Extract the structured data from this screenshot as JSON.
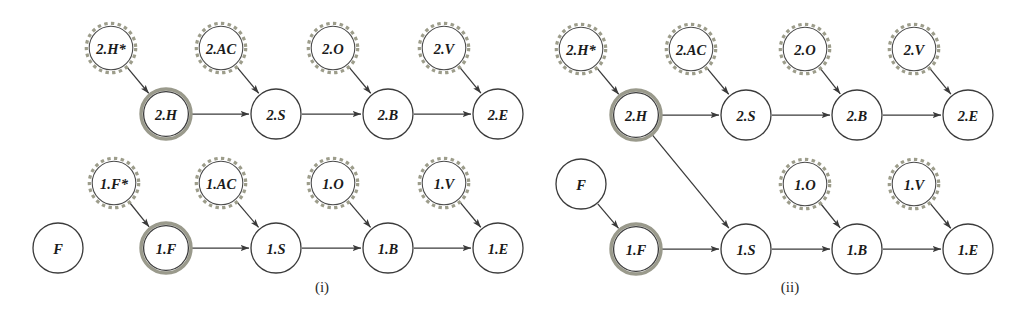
{
  "figure": {
    "background_color": "#ffffff",
    "node_radius": 25,
    "dashed_node_radius": 23,
    "colors": {
      "stroke_dark": "#3b3b3b",
      "stroke_highlight": "#9a9a8c",
      "stroke_dashed": "#9d9d8b",
      "label_text": "#1b1b1b",
      "caption_text": "#2a2a2a",
      "edge": "#3a3a3a"
    },
    "panels": [
      {
        "id": "panel-i",
        "caption": "(i)",
        "caption_x": 322,
        "caption_y": 287,
        "nodes": [
          {
            "id": "i-2H-star",
            "label": "2.H*",
            "x": 111,
            "y": 48,
            "style": "dashed"
          },
          {
            "id": "i-2AC",
            "label": "2.AC",
            "x": 221,
            "y": 48,
            "style": "dashed"
          },
          {
            "id": "i-2O",
            "label": "2.O",
            "x": 333,
            "y": 48,
            "style": "dashed"
          },
          {
            "id": "i-2V",
            "label": "2.V",
            "x": 444,
            "y": 48,
            "style": "dashed"
          },
          {
            "id": "i-2H",
            "label": "2.H",
            "x": 166,
            "y": 114,
            "style": "double"
          },
          {
            "id": "i-2S",
            "label": "2.S",
            "x": 276,
            "y": 114,
            "style": "plain"
          },
          {
            "id": "i-2B",
            "label": "2.B",
            "x": 388,
            "y": 114,
            "style": "plain"
          },
          {
            "id": "i-2E",
            "label": "2.E",
            "x": 498,
            "y": 114,
            "style": "plain"
          },
          {
            "id": "i-1F-star",
            "label": "1.F*",
            "x": 114,
            "y": 183,
            "style": "dashed"
          },
          {
            "id": "i-1AC",
            "label": "1.AC",
            "x": 221,
            "y": 183,
            "style": "dashed"
          },
          {
            "id": "i-1O",
            "label": "1.O",
            "x": 333,
            "y": 183,
            "style": "dashed"
          },
          {
            "id": "i-1V",
            "label": "1.V",
            "x": 444,
            "y": 183,
            "style": "dashed"
          },
          {
            "id": "i-F",
            "label": "F",
            "x": 58,
            "y": 248,
            "style": "plain"
          },
          {
            "id": "i-1F",
            "label": "1.F",
            "x": 166,
            "y": 248,
            "style": "double"
          },
          {
            "id": "i-1S",
            "label": "1.S",
            "x": 276,
            "y": 248,
            "style": "plain"
          },
          {
            "id": "i-1B",
            "label": "1.B",
            "x": 388,
            "y": 248,
            "style": "plain"
          },
          {
            "id": "i-1E",
            "label": "1.E",
            "x": 498,
            "y": 248,
            "style": "plain"
          }
        ],
        "edges": [
          {
            "from": "i-2H-star",
            "to": "i-2H"
          },
          {
            "from": "i-2AC",
            "to": "i-2S"
          },
          {
            "from": "i-2O",
            "to": "i-2B"
          },
          {
            "from": "i-2V",
            "to": "i-2E"
          },
          {
            "from": "i-2H",
            "to": "i-2S"
          },
          {
            "from": "i-2S",
            "to": "i-2B"
          },
          {
            "from": "i-2B",
            "to": "i-2E"
          },
          {
            "from": "i-1F-star",
            "to": "i-1F"
          },
          {
            "from": "i-1AC",
            "to": "i-1S"
          },
          {
            "from": "i-1O",
            "to": "i-1B"
          },
          {
            "from": "i-1V",
            "to": "i-1E"
          },
          {
            "from": "i-1F",
            "to": "i-1S"
          },
          {
            "from": "i-1S",
            "to": "i-1B"
          },
          {
            "from": "i-1B",
            "to": "i-1E"
          }
        ]
      },
      {
        "id": "panel-ii",
        "caption": "(ii)",
        "caption_x": 790,
        "caption_y": 287,
        "nodes": [
          {
            "id": "ii-2H-star",
            "label": "2.H*",
            "x": 581,
            "y": 49,
            "style": "dashed"
          },
          {
            "id": "ii-2AC",
            "label": "2.AC",
            "x": 691,
            "y": 49,
            "style": "dashed"
          },
          {
            "id": "ii-2O",
            "label": "2.O",
            "x": 805,
            "y": 49,
            "style": "dashed"
          },
          {
            "id": "ii-2V",
            "label": "2.V",
            "x": 914,
            "y": 49,
            "style": "dashed"
          },
          {
            "id": "ii-2H",
            "label": "2.H",
            "x": 636,
            "y": 115,
            "style": "double"
          },
          {
            "id": "ii-2S",
            "label": "2.S",
            "x": 746,
            "y": 115,
            "style": "plain"
          },
          {
            "id": "ii-2B",
            "label": "2.B",
            "x": 857,
            "y": 115,
            "style": "plain"
          },
          {
            "id": "ii-2E",
            "label": "2.E",
            "x": 968,
            "y": 115,
            "style": "plain"
          },
          {
            "id": "ii-F",
            "label": "F",
            "x": 581,
            "y": 184,
            "style": "plain"
          },
          {
            "id": "ii-1O",
            "label": "1.O",
            "x": 805,
            "y": 184,
            "style": "dashed"
          },
          {
            "id": "ii-1V",
            "label": "1.V",
            "x": 914,
            "y": 184,
            "style": "dashed"
          },
          {
            "id": "ii-1F",
            "label": "1.F",
            "x": 636,
            "y": 249,
            "style": "double"
          },
          {
            "id": "ii-1S",
            "label": "1.S",
            "x": 746,
            "y": 249,
            "style": "plain"
          },
          {
            "id": "ii-1B",
            "label": "1.B",
            "x": 857,
            "y": 249,
            "style": "plain"
          },
          {
            "id": "ii-1E",
            "label": "1.E",
            "x": 968,
            "y": 249,
            "style": "plain"
          }
        ],
        "edges": [
          {
            "from": "ii-2H-star",
            "to": "ii-2H"
          },
          {
            "from": "ii-2AC",
            "to": "ii-2S"
          },
          {
            "from": "ii-2O",
            "to": "ii-2B"
          },
          {
            "from": "ii-2V",
            "to": "ii-2E"
          },
          {
            "from": "ii-2H",
            "to": "ii-2S"
          },
          {
            "from": "ii-2S",
            "to": "ii-2B"
          },
          {
            "from": "ii-2B",
            "to": "ii-2E"
          },
          {
            "from": "ii-2H",
            "to": "ii-1S"
          },
          {
            "from": "ii-F",
            "to": "ii-1F"
          },
          {
            "from": "ii-1O",
            "to": "ii-1B"
          },
          {
            "from": "ii-1V",
            "to": "ii-1E"
          },
          {
            "from": "ii-1F",
            "to": "ii-1S"
          },
          {
            "from": "ii-1S",
            "to": "ii-1B"
          },
          {
            "from": "ii-1B",
            "to": "ii-1E"
          }
        ]
      }
    ]
  }
}
